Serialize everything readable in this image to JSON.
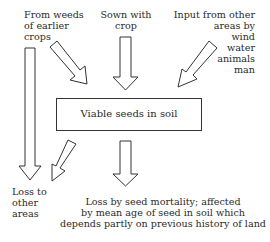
{
  "diagram": {
    "title": "Viable seeds in soil",
    "inputs": [
      {
        "id": "weeds",
        "label": "From weeds\nof earlier\ncrops"
      },
      {
        "id": "sown",
        "label": "Sown with\ncrop"
      },
      {
        "id": "other_areas",
        "label": "Input from other\nareas by\nwind\nwater\nanimals\nman"
      }
    ],
    "outputs": [
      {
        "id": "loss_other_areas",
        "label": "Loss to\nother\nareas"
      },
      {
        "id": "loss_mortality",
        "label": "Loss by seed mortality; affected\nby mean age of seed in soil which\ndepends partly on previous history of land"
      }
    ],
    "colors": {
      "line": "#333333",
      "text": "#2a2a2a",
      "background": "#ffffff"
    }
  }
}
